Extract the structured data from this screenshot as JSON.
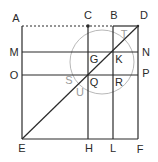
{
  "diagram": {
    "colors": {
      "line": "#2a2a2a",
      "circle": "#b8b8b8",
      "light_label": "#9a9a9a"
    },
    "labels": {
      "A": "A",
      "B": "B",
      "C": "C",
      "D": "D",
      "E": "E",
      "F": "F",
      "G": "G",
      "H": "H",
      "K": "K",
      "L": "L",
      "M": "M",
      "N": "N",
      "O": "O",
      "P": "P",
      "Q": "Q",
      "R": "R",
      "S": "S",
      "T": "T",
      "U": "U"
    }
  }
}
